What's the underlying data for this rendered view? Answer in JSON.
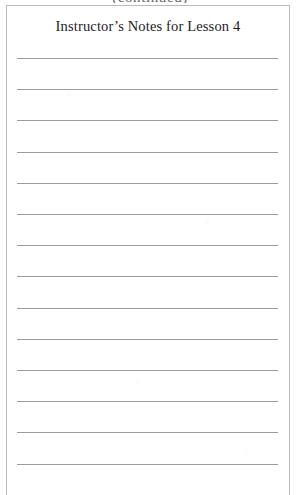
{
  "page": {
    "clipped_text_above_box": "(continued)",
    "background_color": "#ffffff"
  },
  "notes_box": {
    "border_color": "#b9bbbd",
    "fill_color": "#ffffff",
    "title": "Instructor’s Notes for Lesson 4",
    "title_color": "#1d1d1f",
    "rule_line_color": "#9a9c9e",
    "rule_line_count": 14,
    "rule_line_first_y": 52,
    "rule_line_spacing": 31.2,
    "rule_lines": [
      {
        "index": 1,
        "value": ""
      },
      {
        "index": 2,
        "value": ""
      },
      {
        "index": 3,
        "value": ""
      },
      {
        "index": 4,
        "value": ""
      },
      {
        "index": 5,
        "value": ""
      },
      {
        "index": 6,
        "value": ""
      },
      {
        "index": 7,
        "value": ""
      },
      {
        "index": 8,
        "value": ""
      },
      {
        "index": 9,
        "value": ""
      },
      {
        "index": 10,
        "value": ""
      },
      {
        "index": 11,
        "value": ""
      },
      {
        "index": 12,
        "value": ""
      },
      {
        "index": 13,
        "value": ""
      },
      {
        "index": 14,
        "value": ""
      }
    ]
  }
}
